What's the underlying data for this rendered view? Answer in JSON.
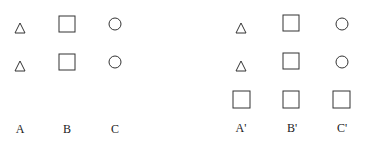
{
  "figure": {
    "left_group": {
      "columns": [
        {
          "label": "A",
          "shapes": [
            "triangle",
            "triangle"
          ]
        },
        {
          "label": "B",
          "shapes": [
            "square",
            "square"
          ]
        },
        {
          "label": "C",
          "shapes": [
            "circle",
            "circle"
          ]
        }
      ]
    },
    "right_group": {
      "columns": [
        {
          "label": "A'",
          "shapes": [
            "triangle",
            "triangle",
            "square"
          ]
        },
        {
          "label": "B'",
          "shapes": [
            "square",
            "square",
            "square"
          ]
        },
        {
          "label": "C'",
          "shapes": [
            "circle",
            "circle",
            "square"
          ]
        }
      ]
    },
    "stroke_color": "#333333"
  }
}
